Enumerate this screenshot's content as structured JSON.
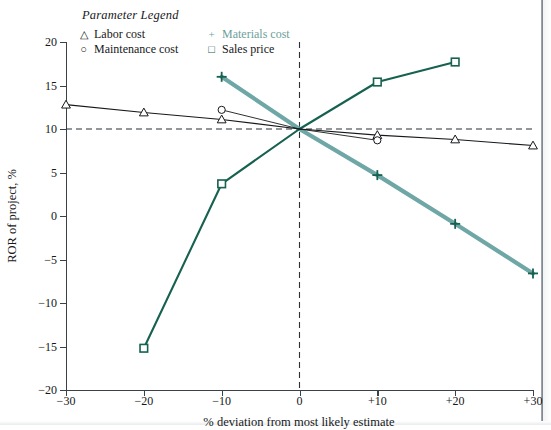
{
  "legend": {
    "title": "Parameter Legend",
    "entries": [
      {
        "symbol": "△",
        "label": "Labor cost",
        "color": "#16181a",
        "label_color": "#16181a"
      },
      {
        "symbol": "+",
        "label": "Materials cost",
        "color": "#64a3a2",
        "label_color": "#6d9e9c"
      },
      {
        "symbol": "○",
        "label": "Maintenance cost",
        "color": "#16181a",
        "label_color": "#16181a"
      },
      {
        "symbol": "□",
        "label": "Sales price",
        "color": "#16614f",
        "label_color": "#16181a"
      }
    ]
  },
  "chart_data": {
    "type": "line",
    "title": "",
    "xlabel": "% deviation from most likely estimate",
    "ylabel": "ROR of project, %",
    "x": [
      -30,
      -20,
      -10,
      0,
      10,
      20,
      30
    ],
    "xtick_labels": [
      "−30",
      "−20",
      "−10",
      "0",
      "+10",
      "+20",
      "+30"
    ],
    "xlim": [
      -30,
      30
    ],
    "ytick_values": [
      20,
      15,
      10,
      5,
      0,
      -5,
      -10,
      -15,
      -20
    ],
    "ytick_labels": [
      "20",
      "15",
      "10",
      "5",
      "0",
      "−5",
      "−10",
      "−15",
      "−20"
    ],
    "ylim": [
      -20,
      20
    ],
    "grid": false,
    "legend_position": "top-left",
    "reference_lines": [
      {
        "name": "base-ror",
        "orientation": "horizontal",
        "value": 10,
        "style": "dashed"
      },
      {
        "name": "base-deviation",
        "orientation": "vertical",
        "value": 0,
        "style": "dashed"
      }
    ],
    "series": [
      {
        "name": "Labor cost",
        "marker": "triangle",
        "color": "#16181a",
        "line_width": 1.1,
        "x": [
          -30,
          -20,
          -10,
          0,
          10,
          20,
          30
        ],
        "values": [
          12.8,
          11.9,
          11.1,
          10.0,
          9.3,
          8.8,
          8.1
        ]
      },
      {
        "name": "Maintenance cost",
        "marker": "circle",
        "color": "#16181a",
        "line_width": 0.9,
        "x": [
          -10,
          0,
          10
        ],
        "values": [
          12.2,
          10.0,
          8.7
        ]
      },
      {
        "name": "Materials cost",
        "marker": "plus",
        "color": "#6fa7a6",
        "line_width": 4.2,
        "x": [
          -10,
          0,
          10,
          20,
          30
        ],
        "values": [
          16.0,
          10.0,
          4.7,
          -0.9,
          -6.6
        ]
      },
      {
        "name": "Sales price",
        "marker": "square",
        "color": "#16614f",
        "line_width": 2.1,
        "x": [
          -20,
          -10,
          0,
          10,
          20
        ],
        "values": [
          -15.2,
          3.7,
          10.0,
          15.4,
          17.7
        ]
      }
    ]
  }
}
